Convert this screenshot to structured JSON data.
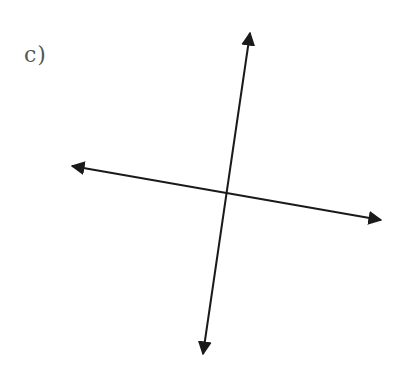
{
  "figure": {
    "label": "c)",
    "line_color": "#1a1a1a",
    "label_color": "#555555",
    "lines": [
      {
        "name": "steep-line",
        "x1": 250,
        "y1": 31,
        "x2": 203,
        "y2": 356
      },
      {
        "name": "shallow-line",
        "x1": 70,
        "y1": 166,
        "x2": 383,
        "y2": 220
      }
    ],
    "intersection": {
      "x": 226,
      "y": 194
    }
  }
}
